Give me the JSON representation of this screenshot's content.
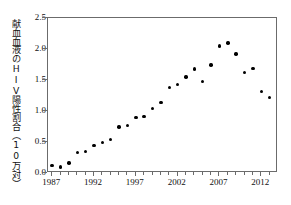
{
  "chart_data": {
    "type": "scatter",
    "title": "",
    "subtitle": "",
    "xlabel": "",
    "ylabel": "献血血液のHIV陽性割合（10万対）",
    "xlim": [
      1986.5,
      2014.0
    ],
    "ylim": [
      0.0,
      2.5
    ],
    "grid": false,
    "legend": "none",
    "y_ticks": [
      "0.0",
      "0.5",
      "1.0",
      "1.5",
      "2.0",
      "2.5"
    ],
    "y_tick_values": [
      0.0,
      0.5,
      1.0,
      1.5,
      2.0,
      2.5
    ],
    "x_ticks": [
      "1987",
      "1992",
      "1997",
      "2002",
      "2007",
      "2012"
    ],
    "x_tick_values": [
      1987,
      1992,
      1997,
      2002,
      2007,
      2012
    ],
    "x_minor_tick_values": [
      1987,
      1988,
      1989,
      1990,
      1991,
      1992,
      1993,
      1994,
      1995,
      1996,
      1997,
      1998,
      1999,
      2000,
      2001,
      2002,
      2003,
      2004,
      2005,
      2006,
      2007,
      2008,
      2009,
      2010,
      2011,
      2012,
      2013
    ],
    "x": [
      1987,
      1988,
      1989,
      1990,
      1991,
      1992,
      1993,
      1994,
      1995,
      1996,
      1997,
      1998,
      1999,
      2000,
      2001,
      2002,
      2003,
      2004,
      2005,
      2006,
      2007,
      2008,
      2009,
      2010,
      2011,
      2012,
      2013
    ],
    "values": [
      0.12,
      0.1,
      0.16,
      0.33,
      0.35,
      0.44,
      0.49,
      0.54,
      0.74,
      0.77,
      0.9,
      0.91,
      1.04,
      1.14,
      1.38,
      1.43,
      1.55,
      1.68,
      1.48,
      1.74,
      2.05,
      2.1,
      1.92,
      1.62,
      1.69,
      1.31,
      1.22
    ],
    "marker": "filled-circle",
    "marker_color": "#000000",
    "axis_color": "#6b6b6b",
    "background_color": "#ffffff"
  }
}
